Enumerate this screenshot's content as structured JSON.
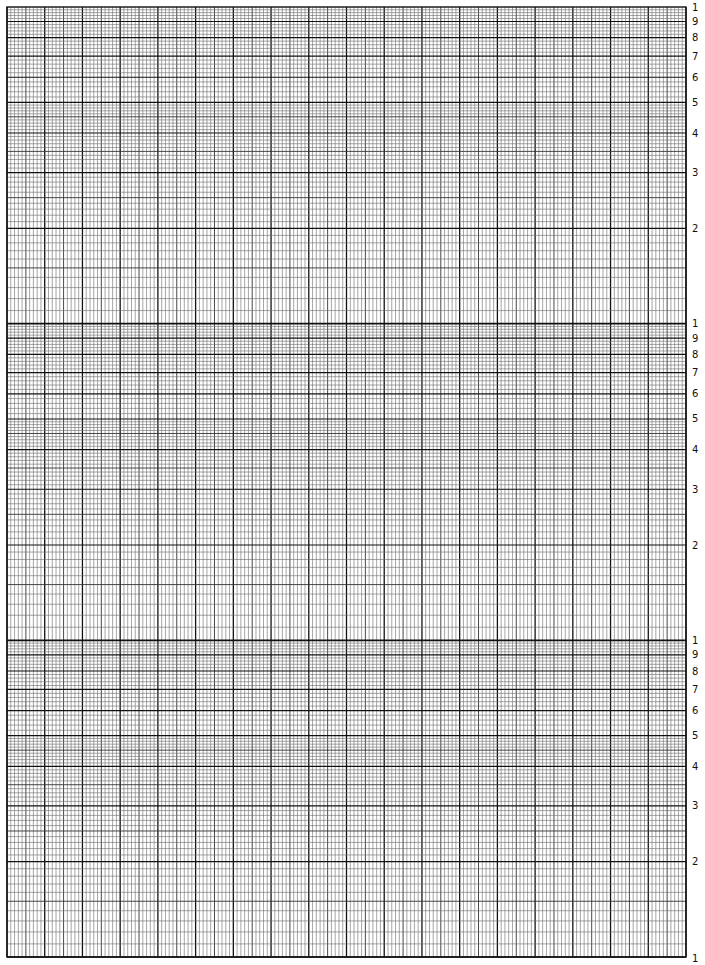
{
  "page": {
    "type": "semi-log graph paper",
    "header_fragment": "",
    "decades": 3,
    "cycle_labels": [
      "1",
      "9",
      "8",
      "7",
      "6",
      "5",
      "4",
      "3",
      "2"
    ],
    "bottom_label": "1",
    "columns": {
      "major": 18,
      "minor_per_major": 10,
      "medium_every": 5
    },
    "log_subdivisions": {
      "1-5": 10,
      "5-10": 5
    },
    "colors": {
      "major_line": "#111111",
      "medium_line": "#333333",
      "minor_line": "#6a6a6a",
      "label": "#111111",
      "background": "#ffffff"
    },
    "grid_bounds": {
      "left": 7,
      "right": 686,
      "top": 7,
      "bottom": 957
    }
  }
}
